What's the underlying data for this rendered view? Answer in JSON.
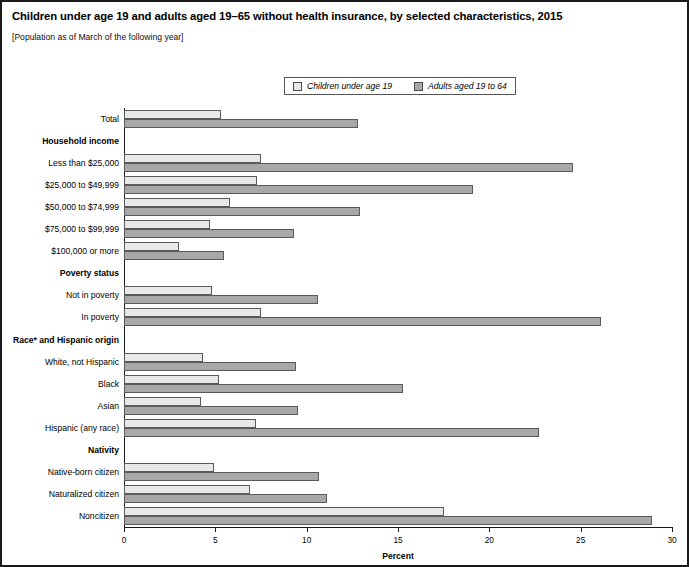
{
  "title": "Children under age 19 and adults aged 19–65 without health insurance, by selected characteristics, 2015",
  "subtitle": "[Population as of March of the following year]",
  "legend": {
    "children_label": "Children under age 19",
    "adults_label": "Adults aged 19 to 64"
  },
  "axis": {
    "xlabel": "Percent",
    "ticks": [
      "0",
      "5",
      "10",
      "15",
      "20",
      "25",
      "30"
    ]
  },
  "colors": {
    "children": "#e8e8e8",
    "adults": "#a8a8a8",
    "border": "#5a5a5a",
    "frame": "#1a1a1a"
  },
  "chart_data": {
    "type": "bar",
    "orientation": "horizontal",
    "title": "Children under age 19 and adults aged 19–65 without health insurance, by selected characteristics, 2015",
    "subtitle": "[Population as of March of the following year]",
    "xlabel": "Percent",
    "ylabel": "",
    "xlim": [
      0,
      30
    ],
    "xticks": [
      0,
      5,
      10,
      15,
      20,
      25,
      30
    ],
    "grid": false,
    "legend_position": "top-center",
    "series": [
      {
        "name": "Children under age 19",
        "color": "#e8e8e8"
      },
      {
        "name": "Adults aged 19 to 64",
        "color": "#a8a8a8"
      }
    ],
    "rows": [
      {
        "label": "Total",
        "header": false,
        "children": 5.3,
        "adults": 12.8
      },
      {
        "label": "Household income",
        "header": true
      },
      {
        "label": "Less than $25,000",
        "header": false,
        "children": 7.5,
        "adults": 24.6
      },
      {
        "label": "$25,000 to $49,999",
        "header": false,
        "children": 7.3,
        "adults": 19.1
      },
      {
        "label": "$50,000 to $74,999",
        "header": false,
        "children": 5.8,
        "adults": 12.9
      },
      {
        "label": "$75,000 to $99,999",
        "header": false,
        "children": 4.7,
        "adults": 9.3
      },
      {
        "label": "$100,000 or more",
        "header": false,
        "children": 3.0,
        "adults": 5.5
      },
      {
        "label": "Poverty status",
        "header": true
      },
      {
        "label": "Not in poverty",
        "header": false,
        "children": 4.8,
        "adults": 10.6
      },
      {
        "label": "In poverty",
        "header": false,
        "children": 7.5,
        "adults": 26.1
      },
      {
        "label": "Race* and Hispanic origin",
        "header": true
      },
      {
        "label": "White, not Hispanic",
        "header": false,
        "children": 4.3,
        "adults": 9.4
      },
      {
        "label": "Black",
        "header": false,
        "children": 5.2,
        "adults": 15.3
      },
      {
        "label": "Asian",
        "header": false,
        "children": 4.2,
        "adults": 9.5
      },
      {
        "label": "Hispanic (any race)",
        "header": false,
        "children": 7.2,
        "adults": 22.7
      },
      {
        "label": "Nativity",
        "header": true
      },
      {
        "label": "Native-born citizen",
        "header": false,
        "children": 4.9,
        "adults": 10.7
      },
      {
        "label": "Naturalized citizen",
        "header": false,
        "children": 6.9,
        "adults": 11.1
      },
      {
        "label": "Noncitizen",
        "header": false,
        "children": 17.5,
        "adults": 28.9
      }
    ]
  }
}
